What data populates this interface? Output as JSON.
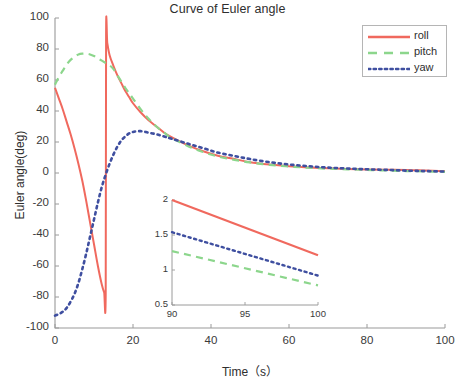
{
  "chart_data": {
    "type": "line",
    "title": "Curve of Euler angle",
    "xlabel": "Time（s）",
    "ylabel": "Euler angle(deg)",
    "xlim": [
      0,
      100
    ],
    "ylim": [
      -100,
      100
    ],
    "xticks": [
      0,
      20,
      40,
      60,
      80,
      100
    ],
    "yticks": [
      -100,
      -80,
      -60,
      -40,
      -20,
      0,
      20,
      40,
      60,
      80,
      100
    ],
    "grid": false,
    "legend_position": "top-right",
    "legend": [
      "roll",
      "pitch",
      "yaw"
    ],
    "colors": {
      "roll": "#F0695E",
      "pitch": "#8CD68C",
      "yaw": "#3F4FA0",
      "axis": "#9a9a9a",
      "text": "#2e2e2e"
    },
    "series": [
      {
        "name": "roll",
        "style": "solid",
        "color": "#F0695E",
        "x": [
          0,
          1,
          2,
          3,
          4,
          5,
          6,
          7,
          8,
          9,
          10,
          11,
          12,
          12.6,
          13.0,
          13.1,
          13.4,
          14,
          15,
          16,
          17,
          18,
          19,
          20,
          22,
          24,
          26,
          28,
          30,
          34,
          38,
          42,
          46,
          50,
          55,
          60,
          65,
          70,
          75,
          80,
          85,
          90,
          95,
          100
        ],
        "y": [
          55,
          48,
          41,
          33,
          25,
          16,
          6,
          -5,
          -18,
          -32,
          -46,
          -60,
          -72,
          -77,
          -78,
          90,
          84,
          76,
          69,
          63,
          58,
          53,
          49,
          45,
          39,
          34,
          30,
          26,
          23,
          18,
          14,
          11,
          9,
          7,
          5.5,
          4.4,
          3.6,
          3.0,
          2.6,
          2.3,
          2.1,
          2.0,
          1.6,
          1.2
        ]
      },
      {
        "name": "pitch",
        "style": "dashed",
        "color": "#8CD68C",
        "x": [
          0,
          1,
          2,
          3,
          4,
          5,
          6,
          7,
          8,
          9,
          10,
          11,
          12,
          13,
          14,
          15,
          16,
          17,
          18,
          19,
          20,
          22,
          24,
          26,
          28,
          30,
          34,
          38,
          42,
          46,
          50,
          55,
          60,
          65,
          70,
          75,
          80,
          85,
          90,
          95,
          100
        ],
        "y": [
          57,
          62,
          66,
          70,
          73,
          75,
          76.5,
          77,
          77,
          76.5,
          75.5,
          74,
          72.5,
          71,
          69.5,
          67,
          63,
          59,
          55,
          51.5,
          48,
          41,
          35,
          30,
          26,
          22.5,
          17.5,
          13.5,
          10.5,
          8.5,
          6.8,
          5.2,
          4.2,
          3.4,
          2.8,
          2.4,
          2.0,
          1.6,
          1.27,
          1.0,
          0.78
        ]
      },
      {
        "name": "yaw",
        "style": "dotted",
        "color": "#3F4FA0",
        "x": [
          0,
          1,
          2,
          3,
          4,
          5,
          6,
          7,
          8,
          9,
          10,
          11,
          12,
          13,
          14,
          15,
          16,
          17,
          18,
          19,
          20,
          22,
          24,
          26,
          28,
          30,
          34,
          38,
          42,
          46,
          50,
          55,
          60,
          65,
          70,
          75,
          80,
          85,
          90,
          95,
          100
        ],
        "y": [
          -92,
          -91,
          -89.5,
          -87,
          -83,
          -78,
          -71,
          -62,
          -52,
          -41,
          -30,
          -19,
          -9,
          -1,
          6,
          12,
          17,
          21,
          23.5,
          25.5,
          26.5,
          27,
          26,
          25,
          23.5,
          22,
          19,
          16,
          13,
          11,
          9,
          7,
          5.5,
          4.4,
          3.5,
          2.9,
          2.4,
          2.0,
          1.55,
          1.22,
          0.92
        ]
      }
    ],
    "inset": {
      "xlim": [
        90,
        100
      ],
      "ylim": [
        0.5,
        2
      ],
      "xticks": [
        90,
        95,
        100
      ],
      "yticks": [
        0.5,
        1,
        1.5,
        2
      ],
      "series": [
        {
          "name": "roll",
          "style": "solid",
          "color": "#F0695E",
          "x": [
            90,
            100
          ],
          "y": [
            2.0,
            1.21
          ]
        },
        {
          "name": "pitch",
          "style": "dashed",
          "color": "#8CD68C",
          "x": [
            90,
            100
          ],
          "y": [
            1.27,
            0.78
          ]
        },
        {
          "name": "yaw",
          "style": "dotted",
          "color": "#3F4FA0",
          "x": [
            90,
            100
          ],
          "y": [
            1.54,
            0.92
          ]
        }
      ]
    }
  }
}
